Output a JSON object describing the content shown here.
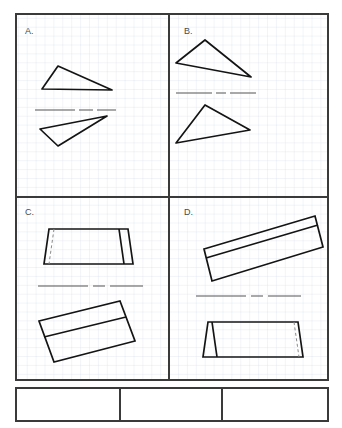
{
  "worksheet": {
    "title": "",
    "background_color": "#ffffff",
    "grid_color": "#d4d9e4",
    "frame_color": "#3a3a3a",
    "shape_color": "#141414",
    "mirror_line_color": "#555555",
    "label_color": "#4a4a4a",
    "grid_spacing_px": 8.9
  },
  "frame": {
    "outer": {
      "x": 16,
      "y": 14,
      "width": 312,
      "height": 366
    },
    "vertical_divider_x": 169,
    "horizontal_divider_y": 197
  },
  "quadrants": [
    {
      "id": "A",
      "label": "A.",
      "label_x": 25,
      "label_y": 34,
      "mirror_line": {
        "x1": 35,
        "y1": 110,
        "x2": 116,
        "y2": 110
      },
      "shapes": [
        {
          "name": "triangle-upper",
          "kind": "triangle",
          "points": "58,66 42,89 112,90"
        },
        {
          "name": "triangle-lower",
          "kind": "triangle",
          "points": "40,129 58,146 107,116"
        }
      ]
    },
    {
      "id": "B",
      "label": "B.",
      "label_x": 184,
      "label_y": 34,
      "mirror_line": {
        "x1": 176,
        "y1": 93,
        "x2": 256,
        "y2": 93
      },
      "shapes": [
        {
          "name": "triangle-upper",
          "kind": "triangle",
          "points": "205,40 176,63 251,77"
        },
        {
          "name": "triangle-lower",
          "kind": "triangle",
          "points": "205,105 176,143 250,130"
        }
      ]
    },
    {
      "id": "C",
      "label": "C.",
      "label_x": 25,
      "label_y": 215,
      "mirror_line": {
        "x1": 38,
        "y1": 286,
        "x2": 143,
        "y2": 286
      },
      "shapes": [
        {
          "name": "prism-upper",
          "kind": "triangular-prism",
          "outline": "49,229 128,229 133,264 44,264",
          "edge_left_solid": "49,229 44,264",
          "edge_right_solid": "128,229 133,264",
          "front_apex_edge_solid": "119,229 124,264",
          "hidden_edge_dashed": "54,229 49,264"
        },
        {
          "name": "prism-lower-rotated",
          "kind": "rotated-prism",
          "outline": "39,321 120,301 135,341 54,362",
          "inner_edge": "44,337 126,317"
        }
      ]
    },
    {
      "id": "D",
      "label": "D.",
      "label_x": 184,
      "label_y": 215,
      "mirror_line": {
        "x1": 196,
        "y1": 296,
        "x2": 301,
        "y2": 296
      },
      "shapes": [
        {
          "name": "prism-upper-rotated",
          "kind": "rotated-prism",
          "outline": "204,249 315,216 323,247 212,281",
          "inner_edge": "206,258 318,225"
        },
        {
          "name": "prism-lower",
          "kind": "triangular-prism",
          "outline": "208,322 298,322 303,357 203,357",
          "edge_left_solid": "208,322 203,357",
          "edge_right_solid": "298,322 303,357",
          "front_apex_edge_solid": "212,322 217,357",
          "hidden_edge_dashed": "294,322 299,357"
        }
      ]
    }
  ],
  "answer_boxes": [
    {
      "name": "answer-box-1",
      "x": 16,
      "y": 388,
      "width": 104,
      "height": 33,
      "text": ""
    },
    {
      "name": "answer-box-2",
      "x": 120,
      "y": 388,
      "width": 102,
      "height": 33,
      "text": ""
    },
    {
      "name": "answer-box-3",
      "x": 222,
      "y": 388,
      "width": 106,
      "height": 33,
      "text": ""
    }
  ]
}
